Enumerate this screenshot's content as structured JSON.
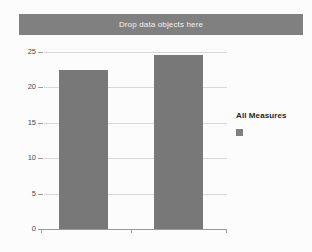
{
  "drop_zone": {
    "label": "Drop data objects here"
  },
  "legend": {
    "title": "All Measures",
    "swatch_color": "#808080",
    "position": "right"
  },
  "colors": {
    "bar": "#787878",
    "drop_zone_bg": "#808080",
    "gridline": "#d8d8d8",
    "axis": "#9a9a9a",
    "background": "#fcfcfc",
    "tick_text": "#4a4a4a"
  },
  "chart_data": {
    "type": "bar",
    "title": "",
    "subtitle": "",
    "xlabel": "",
    "ylabel": "",
    "categories": [
      "",
      ""
    ],
    "values": [
      22.5,
      24.6
    ],
    "series": [
      {
        "name": "All Measures",
        "values": [
          22.5,
          24.6
        ],
        "color": "#787878"
      }
    ],
    "ylim": [
      0,
      25
    ],
    "yticks": [
      0,
      5,
      10,
      15,
      20,
      25
    ],
    "ytick_labels": [
      "0",
      "5",
      "10",
      "15",
      "20",
      "25"
    ],
    "xticks": [],
    "xtick_labels": [],
    "grid": true,
    "grid_axis": "y",
    "legend_position": "right"
  }
}
